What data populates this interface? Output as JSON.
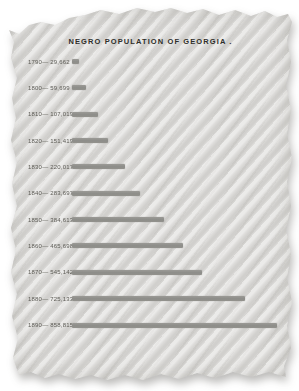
{
  "chart_data": {
    "type": "bar",
    "orientation": "horizontal",
    "title": "NEGRO POPULATION OF GEORGIA .",
    "categories": [
      "1790",
      "1800",
      "1810",
      "1820",
      "1830",
      "1840",
      "1850",
      "1860",
      "1870",
      "1880",
      "1890"
    ],
    "values": [
      29662,
      59699,
      107019,
      151419,
      220017,
      283697,
      384613,
      465698,
      545142,
      725133,
      858815
    ],
    "value_labels": [
      "29,662",
      "59,699",
      "107,019",
      "151,419",
      "220,017",
      "283,697",
      "384,613",
      "465,698",
      "545,142",
      "725,133",
      "858,815"
    ],
    "xlabel": "",
    "ylabel": "",
    "xlim": [
      0,
      858815
    ],
    "grid": false,
    "legend": "none",
    "bar_color": "#8d8d89",
    "label_separator": "— "
  },
  "colors": {
    "background": "#ffffff",
    "paper": "#dedddb",
    "stripe_dark": "#cfceca",
    "stripe_light": "#e6e5e1",
    "bar": "#8d8d89",
    "label_text": "#5c5b55",
    "title_text": "#2f2e2a"
  }
}
